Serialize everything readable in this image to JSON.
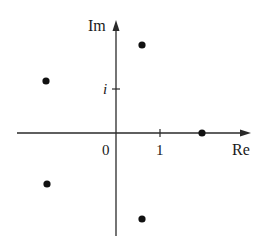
{
  "diagram": {
    "type": "complex-plane",
    "axes": {
      "real_label": "Re",
      "imag_label": "Im",
      "origin_label": "0",
      "real_tick_label": "1",
      "imag_tick_label": "i"
    },
    "points": [
      {
        "re": 2.0,
        "im": 0.0
      },
      {
        "re": 0.62,
        "im": 1.9
      },
      {
        "re": -1.62,
        "im": 1.18
      },
      {
        "re": -1.62,
        "im": -1.18
      },
      {
        "re": 0.62,
        "im": -1.9
      }
    ],
    "colors": {
      "axis": "#2a2a2a",
      "point": "#111111",
      "background": "#ffffff"
    }
  }
}
